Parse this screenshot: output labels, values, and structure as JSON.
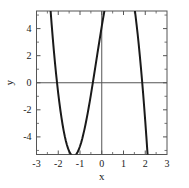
{
  "chart_data": {
    "type": "line",
    "title": "",
    "xlabel": "x",
    "ylabel": "y",
    "xlim": [
      -3,
      3
    ],
    "ylim": [
      -5.3,
      5.3
    ],
    "xticks": [
      -3,
      -2,
      -1,
      0,
      1,
      2,
      3
    ],
    "xticklabels": [
      "-3",
      "-2",
      "-1",
      "0",
      "1",
      "2",
      "3"
    ],
    "yticks": [
      -4,
      -2,
      0,
      2,
      4
    ],
    "yticklabels": [
      "-4",
      "-2",
      "0",
      "2",
      "4"
    ],
    "minor_xticks": [
      -2.5,
      -1.5,
      -0.5,
      0.5,
      1.5,
      2.5
    ],
    "minor_yticks": [
      -5,
      -3,
      -1,
      1,
      3,
      5
    ],
    "grid": false,
    "legend": null,
    "legend_position": "none",
    "line_color": "#1a1a1a",
    "line_width": 2.0,
    "axis_color": "#555555",
    "frame_color": "#555555",
    "zero_lines": true,
    "series": [
      {
        "name": "quartic",
        "expression": "y = x^4 + x^3 - 4x^2 - 2x + 1",
        "x": [
          -2.35,
          -2.3,
          -2.25,
          -2.2,
          -2.15,
          -2.1,
          -2.05,
          -2.0,
          -1.95,
          -1.9,
          -1.85,
          -1.8,
          -1.75,
          -1.7,
          -1.65,
          -1.6,
          -1.55,
          -1.5,
          -1.45,
          -1.4,
          -1.35,
          -1.3,
          -1.25,
          -1.2,
          -1.15,
          -1.1,
          -1.05,
          -1.0,
          -0.95,
          -0.9,
          -0.85,
          -0.8,
          -0.75,
          -0.7,
          -0.65,
          -0.6,
          -0.55,
          -0.5,
          -0.45,
          -0.4,
          -0.35,
          -0.3,
          -0.25,
          -0.2,
          -0.15,
          -0.1,
          -0.05,
          0.0,
          0.05,
          0.1,
          0.15,
          0.2,
          0.25,
          0.3,
          0.35,
          0.4,
          0.45,
          0.5,
          0.55,
          0.6,
          0.65,
          0.7,
          0.75,
          0.8,
          0.85,
          0.9,
          0.95,
          1.0,
          1.05,
          1.1,
          1.15,
          1.2,
          1.25,
          1.3,
          1.35,
          1.4,
          1.45,
          1.5,
          1.55,
          1.6,
          1.65,
          1.7,
          1.75,
          1.8,
          1.85,
          1.9,
          1.95,
          2.0,
          2.05,
          2.1,
          2.15,
          2.2,
          2.25,
          2.3,
          2.35,
          2.4
        ],
        "y": [
          5.28,
          4.24,
          3.26,
          2.34,
          1.47,
          0.66,
          -0.09,
          -0.8,
          -1.45,
          -2.05,
          -2.6,
          -3.1,
          -3.55,
          -3.95,
          -4.3,
          -4.6,
          -4.85,
          -5.06,
          -5.22,
          -5.33,
          -5.4,
          -5.42,
          -5.4,
          -5.34,
          -5.23,
          -5.09,
          -4.91,
          -4.69,
          -4.44,
          -4.15,
          -3.83,
          -3.48,
          -3.1,
          -2.7,
          -2.28,
          -1.83,
          -1.37,
          -0.89,
          -0.4,
          0.1,
          0.61,
          1.12,
          1.64,
          2.15,
          2.66,
          3.17,
          3.67,
          4.16,
          4.64,
          5.11,
          5.56,
          5.99,
          6.41,
          6.8,
          7.17,
          7.52,
          7.84,
          8.13,
          8.39,
          8.62,
          8.81,
          8.97,
          9.09,
          9.17,
          9.21,
          9.21,
          9.17,
          9.08,
          8.95,
          8.77,
          8.55,
          8.28,
          7.96,
          7.59,
          7.17,
          6.7,
          6.18,
          5.61,
          4.99,
          4.32,
          3.6,
          2.83,
          2.01,
          1.14,
          0.22,
          -0.75,
          -1.77,
          -2.84,
          -3.96,
          -5.13,
          -6.35,
          -7.62,
          -8.94,
          -10.31,
          -11.73,
          -13.2
        ]
      }
    ],
    "annotations": {
      "left_minimum": {
        "x": -1.5,
        "y": -4.5
      },
      "central_maximum": {
        "x": 0.05,
        "y": 1.0
      },
      "right_minimum": {
        "x": 1.4,
        "y": -1.65
      },
      "roots_approx": [
        -2.05,
        -0.75,
        0.55,
        1.85
      ]
    }
  }
}
